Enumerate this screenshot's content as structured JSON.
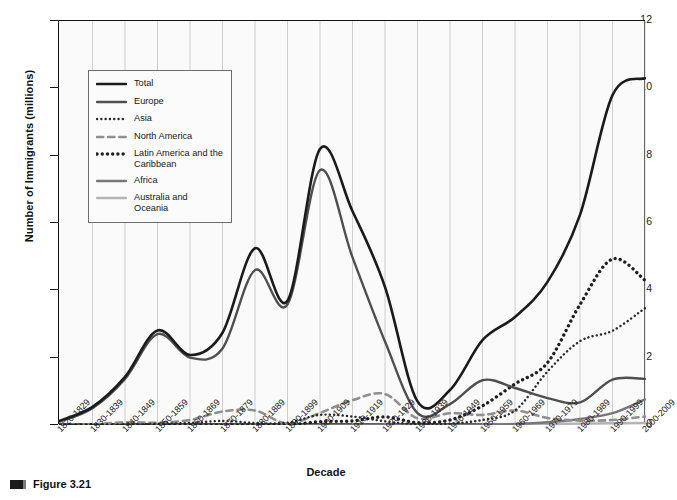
{
  "figure": {
    "caption": "Figure 3.21",
    "marker": "figure-square-marker"
  },
  "chart_data": {
    "type": "line",
    "title": "",
    "xlabel": "Decade",
    "ylabel": "Number of Immigrants (millions)",
    "ylim": [
      0,
      12
    ],
    "yticks": [
      0,
      2,
      4,
      6,
      8,
      10,
      12
    ],
    "grid": "vertical",
    "legend_position": "upper-left-inside",
    "categories": [
      "1820-1829",
      "1830-1839",
      "1840-1849",
      "1850-1859",
      "1860-1869",
      "1870-1879",
      "1880-1889",
      "1890-1899",
      "1900-1909",
      "1910-1919",
      "1920-1929",
      "1930-1939",
      "1940-1949",
      "1950-1959",
      "1960-1969",
      "1970-1979",
      "1980-1989",
      "1990-1999",
      "2000-2009"
    ],
    "series": [
      {
        "name": "Total",
        "color": "#1b1b1b",
        "style": "solid",
        "width": 2.6,
        "values": [
          0.13,
          0.54,
          1.43,
          2.81,
          2.08,
          2.74,
          5.25,
          3.69,
          8.2,
          6.35,
          4.1,
          0.7,
          1.04,
          2.52,
          3.21,
          4.25,
          6.24,
          9.8,
          10.3
        ]
      },
      {
        "name": "Europe",
        "color": "#4f4f4f",
        "style": "solid",
        "width": 2.4,
        "values": [
          0.1,
          0.5,
          1.37,
          2.7,
          2.0,
          2.27,
          4.6,
          3.58,
          7.57,
          4.98,
          2.48,
          0.35,
          0.62,
          1.33,
          1.1,
          0.8,
          0.67,
          1.35,
          1.37
        ]
      },
      {
        "name": "Asia",
        "color": "#2a2a2a",
        "style": "fine-dot",
        "width": 2.4,
        "values": [
          0.0,
          0.0,
          0.0,
          0.04,
          0.06,
          0.12,
          0.06,
          0.07,
          0.3,
          0.25,
          0.11,
          0.02,
          0.04,
          0.15,
          0.43,
          1.59,
          2.49,
          2.8,
          3.47
        ]
      },
      {
        "name": "North America",
        "color": "#8f8f8f",
        "style": "dash",
        "width": 2.6,
        "values": [
          0.01,
          0.02,
          0.08,
          0.07,
          0.15,
          0.4,
          0.43,
          0.04,
          0.36,
          0.74,
          0.92,
          0.2,
          0.35,
          0.3,
          0.43,
          0.21,
          0.13,
          0.15,
          0.25
        ]
      },
      {
        "name": "Latin America and the Caribbean",
        "color": "#1f1f1f",
        "style": "thick-dot",
        "width": 3.3,
        "values": [
          0.0,
          0.0,
          0.0,
          0.0,
          0.0,
          0.0,
          0.0,
          0.0,
          0.1,
          0.12,
          0.24,
          0.07,
          0.15,
          0.57,
          1.22,
          1.85,
          3.58,
          4.93,
          4.3
        ]
      },
      {
        "name": "Africa",
        "color": "#777777",
        "style": "solid",
        "width": 2.4,
        "values": [
          0.0,
          0.0,
          0.0,
          0.0,
          0.0,
          0.0,
          0.0,
          0.0,
          0.0,
          0.01,
          0.01,
          0.0,
          0.01,
          0.01,
          0.03,
          0.08,
          0.18,
          0.35,
          0.76
        ]
      },
      {
        "name": "Australia and Oceania",
        "color": "#b4b4b4",
        "style": "solid",
        "width": 2.4,
        "values": [
          0.0,
          0.0,
          0.0,
          0.0,
          0.0,
          0.0,
          0.0,
          0.0,
          0.0,
          0.0,
          0.01,
          0.0,
          0.0,
          0.01,
          0.02,
          0.03,
          0.04,
          0.05,
          0.06
        ]
      }
    ]
  }
}
